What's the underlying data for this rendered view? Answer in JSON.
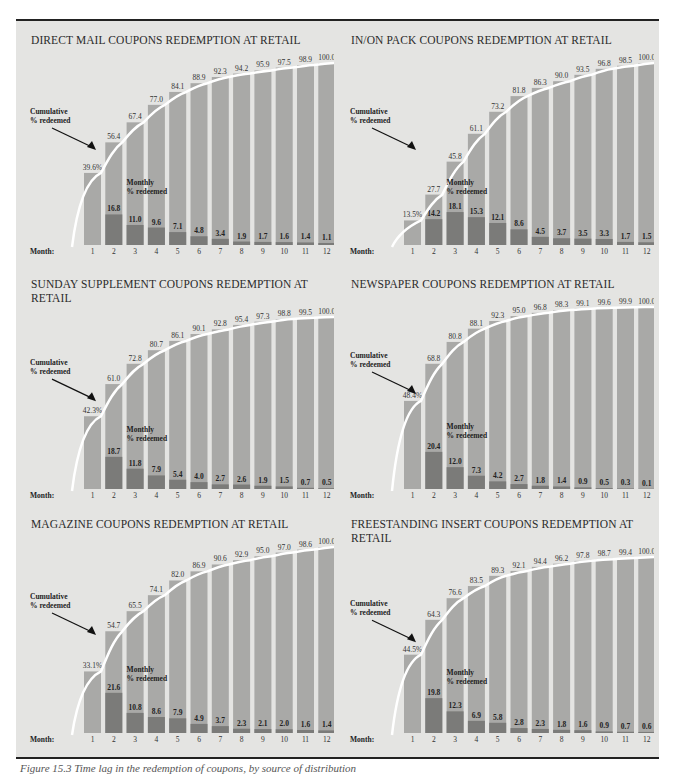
{
  "figure": {
    "caption": "Figure 15.3 Time lag in the redemption of coupons, by source of distribution"
  },
  "labels": {
    "cumulative": [
      "Cumulative",
      "% redeemed"
    ],
    "monthly": [
      "Monthly",
      "% redeemed"
    ],
    "month": "Month:"
  },
  "colors": {
    "background": "#e4e4e2",
    "cumulative_bar": "#a9a9a7",
    "monthly_bar": "#7b7b79",
    "curve": "#ffffff",
    "text": "#2b2b2b"
  },
  "chart_data": [
    {
      "type": "bar",
      "title": "DIRECT MAIL COUPONS REDEMPTION AT RETAIL",
      "categories": [
        "1",
        "2",
        "3",
        "4",
        "5",
        "6",
        "7",
        "8",
        "9",
        "10",
        "11",
        "12"
      ],
      "xlabel": "Month:",
      "series": [
        {
          "name": "Cumulative % redeemed",
          "values": [
            39.6,
            56.4,
            67.4,
            77.0,
            84.1,
            88.9,
            92.3,
            94.2,
            95.9,
            97.5,
            98.9,
            100.0
          ]
        },
        {
          "name": "Monthly % redeemed",
          "values": [
            39.6,
            16.8,
            11.0,
            9.6,
            7.1,
            4.8,
            3.4,
            1.9,
            1.7,
            1.6,
            1.4,
            1.1
          ]
        }
      ],
      "first_label": "39.6%",
      "ylim": [
        0,
        100
      ]
    },
    {
      "type": "bar",
      "title": "IN/ON PACK COUPONS REDEMPTION AT RETAIL",
      "categories": [
        "1",
        "2",
        "3",
        "4",
        "5",
        "6",
        "7",
        "8",
        "9",
        "10",
        "11",
        "12"
      ],
      "xlabel": "Month:",
      "series": [
        {
          "name": "Cumulative % redeemed",
          "values": [
            13.5,
            27.7,
            45.8,
            61.1,
            73.2,
            81.8,
            86.3,
            90.0,
            93.5,
            96.8,
            98.5,
            100.0
          ]
        },
        {
          "name": "Monthly % redeemed",
          "values": [
            13.5,
            14.2,
            18.1,
            15.3,
            12.1,
            8.6,
            4.5,
            3.7,
            3.5,
            3.3,
            1.7,
            1.5
          ]
        }
      ],
      "first_label": "13.5%",
      "ylim": [
        0,
        100
      ]
    },
    {
      "type": "bar",
      "title": "SUNDAY SUPPLEMENT COUPONS REDEMPTION AT RETAIL",
      "categories": [
        "1",
        "2",
        "3",
        "4",
        "5",
        "6",
        "7",
        "8",
        "9",
        "10",
        "11",
        "12"
      ],
      "xlabel": "Month:",
      "series": [
        {
          "name": "Cumulative % redeemed",
          "values": [
            42.3,
            61.0,
            72.8,
            80.7,
            86.1,
            90.1,
            92.8,
            95.4,
            97.3,
            98.8,
            99.5,
            100.0
          ]
        },
        {
          "name": "Monthly % redeemed",
          "values": [
            42.3,
            18.7,
            11.8,
            7.9,
            5.4,
            4.0,
            2.7,
            2.6,
            1.9,
            1.5,
            0.7,
            0.5
          ]
        }
      ],
      "first_label": "42.3%",
      "ylim": [
        0,
        100
      ]
    },
    {
      "type": "bar",
      "title": "NEWSPAPER COUPONS REDEMPTION AT RETAIL",
      "categories": [
        "1",
        "2",
        "3",
        "4",
        "5",
        "6",
        "7",
        "8",
        "9",
        "10",
        "11",
        "12"
      ],
      "xlabel": "Month:",
      "series": [
        {
          "name": "Cumulative % redeemed",
          "values": [
            48.4,
            68.8,
            80.8,
            88.1,
            92.3,
            95.0,
            96.8,
            98.3,
            99.1,
            99.6,
            99.9,
            100.0
          ]
        },
        {
          "name": "Monthly % redeemed",
          "values": [
            48.4,
            20.4,
            12.0,
            7.3,
            4.2,
            2.7,
            1.8,
            1.4,
            0.9,
            0.5,
            0.3,
            0.1
          ]
        }
      ],
      "first_label": "48.4%",
      "ylim": [
        0,
        100
      ]
    },
    {
      "type": "bar",
      "title": "MAGAZINE COUPONS REDEMPTION AT RETAIL",
      "categories": [
        "1",
        "2",
        "3",
        "4",
        "5",
        "6",
        "7",
        "8",
        "9",
        "10",
        "11",
        "12"
      ],
      "xlabel": "Month:",
      "series": [
        {
          "name": "Cumulative % redeemed",
          "values": [
            33.1,
            54.7,
            65.5,
            74.1,
            82.0,
            86.9,
            90.6,
            92.9,
            95.0,
            97.0,
            98.6,
            100.0
          ]
        },
        {
          "name": "Monthly % redeemed",
          "values": [
            33.1,
            21.6,
            10.8,
            8.6,
            7.9,
            4.9,
            3.7,
            2.3,
            2.1,
            2.0,
            1.6,
            1.4
          ]
        }
      ],
      "first_label": "33.1%",
      "ylim": [
        0,
        100
      ]
    },
    {
      "type": "bar",
      "title": "FREESTANDING INSERT COUPONS REDEMPTION AT RETAIL",
      "categories": [
        "1",
        "2",
        "3",
        "4",
        "5",
        "6",
        "7",
        "8",
        "9",
        "10",
        "11",
        "12"
      ],
      "xlabel": "Month:",
      "series": [
        {
          "name": "Cumulative % redeemed",
          "values": [
            44.5,
            64.3,
            76.6,
            83.5,
            89.3,
            92.1,
            94.4,
            96.2,
            97.8,
            98.7,
            99.4,
            100.0
          ]
        },
        {
          "name": "Monthly % redeemed",
          "values": [
            44.5,
            19.8,
            12.3,
            6.9,
            5.8,
            2.8,
            2.3,
            1.8,
            1.6,
            0.9,
            0.7,
            0.6
          ]
        }
      ],
      "first_label": "44.5%",
      "ylim": [
        0,
        100
      ]
    }
  ]
}
